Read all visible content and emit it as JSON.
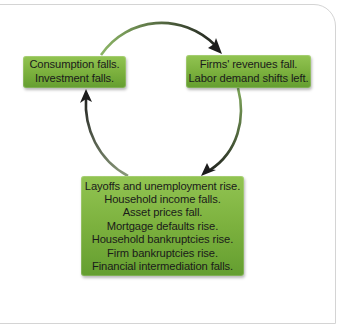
{
  "diagram": {
    "type": "cycle",
    "nodes": [
      {
        "id": "left",
        "lines": [
          "Consumption falls.",
          "Investment falls."
        ]
      },
      {
        "id": "right",
        "lines": [
          "Firms' revenues fall.",
          "Labor demand shifts left."
        ]
      },
      {
        "id": "bottom",
        "lines": [
          "Layoffs and unemployment rise.",
          "Household income falls.",
          "Asset prices fall.",
          "Mortgage defaults rise.",
          "Household bankruptcies rise.",
          "Firm bankruptcies rise.",
          "Financial intermediation falls."
        ]
      }
    ],
    "edges": [
      {
        "from": "left",
        "to": "right",
        "direction": "clockwise"
      },
      {
        "from": "right",
        "to": "bottom",
        "direction": "clockwise"
      },
      {
        "from": "bottom",
        "to": "left",
        "direction": "clockwise"
      }
    ],
    "colors": {
      "node_fill_top": "#92c452",
      "node_fill_bottom": "#649e30",
      "arrow_start": "#7fa85a",
      "arrow_end": "#1c1c1c",
      "panel_border": "#d4d4d4",
      "text": "#1a1a1a"
    }
  }
}
